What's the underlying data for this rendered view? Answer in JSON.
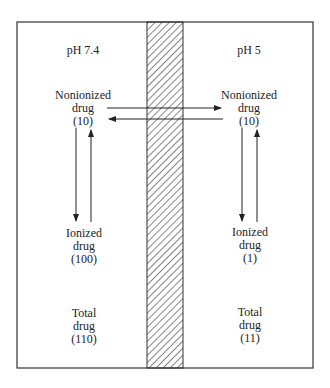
{
  "compartments": {
    "left": {
      "ph_label": "pH 7.4",
      "nonionized": {
        "line1": "Nonionized",
        "line2": "drug",
        "value": "(10)"
      },
      "ionized": {
        "line1": "Ionized",
        "line2": "drug",
        "value": "(100)"
      },
      "total": {
        "line1": "Total",
        "line2": "drug",
        "value": "(110)"
      }
    },
    "right": {
      "ph_label": "pH 5",
      "nonionized": {
        "line1": "Nonionized",
        "line2": "drug",
        "value": "(10)"
      },
      "ionized": {
        "line1": "Ionized",
        "line2": "drug",
        "value": "(1)"
      },
      "total": {
        "line1": "Total",
        "line2": "drug",
        "value": "(11)"
      }
    }
  },
  "membrane": {
    "pattern": "diagonal-hatch"
  },
  "colors": {
    "line": "#333333",
    "background": "#ffffff"
  }
}
